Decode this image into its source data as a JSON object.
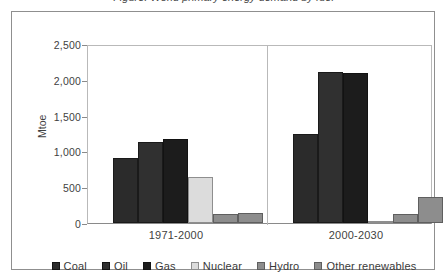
{
  "figure": {
    "caption_clipped": "Figure: World primary energy demand by fuel",
    "frame_border_color": "#8f8f8f"
  },
  "chart_data": {
    "type": "bar",
    "title": "",
    "xlabel": "",
    "ylabel": "Mtoe",
    "categories": [
      "1971-2000",
      "2000-2030"
    ],
    "series": [
      {
        "name": "Coal",
        "color": "#2b2b2b",
        "values": [
          910,
          1240
        ]
      },
      {
        "name": "Oil",
        "color": "#303030",
        "values": [
          1130,
          2110
        ]
      },
      {
        "name": "Gas",
        "color": "#1c1c1c",
        "values": [
          1180,
          2100
        ]
      },
      {
        "name": "Nuclear",
        "color": "#dcdcdc",
        "values": [
          640,
          20
        ]
      },
      {
        "name": "Hydro",
        "color": "#8d8d8d",
        "values": [
          120,
          125
        ]
      },
      {
        "name": "Other renewables",
        "color": "#8d8d8d",
        "values": [
          145,
          370
        ]
      }
    ],
    "ylim": [
      0,
      2500
    ],
    "yticks": [
      0,
      500,
      1000,
      1500,
      2000,
      2500
    ],
    "ytick_labels": [
      "0",
      "500",
      "1,000",
      "1,500",
      "2,000",
      "2,500"
    ],
    "grid": false,
    "legend_position": "bottom",
    "group_divider": true
  }
}
